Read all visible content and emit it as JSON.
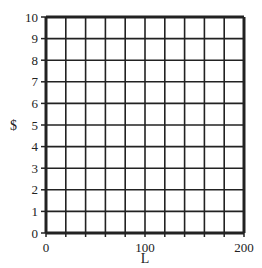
{
  "chart_data": {
    "type": "line",
    "title": "",
    "xlabel": "L",
    "ylabel": "$",
    "x_ticks": [
      "0",
      "100",
      "200"
    ],
    "y_ticks": [
      "0",
      "1",
      "2",
      "3",
      "4",
      "5",
      "6",
      "7",
      "8",
      "9",
      "10"
    ],
    "xlim": [
      0,
      200
    ],
    "ylim": [
      0,
      10
    ],
    "grid": true,
    "grid_columns": 10,
    "grid_rows": 10,
    "series": [],
    "note": "Blank grid for plotting; top title text is cut off"
  },
  "colors": {
    "grid": "#222222",
    "background": "#ffffff"
  }
}
